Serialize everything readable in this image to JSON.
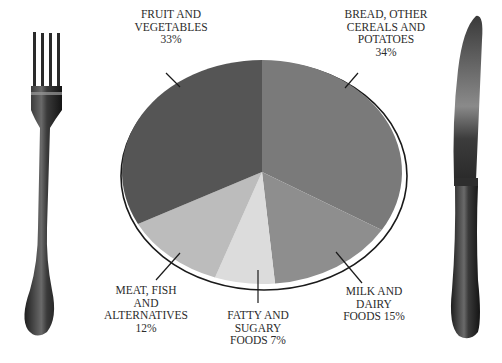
{
  "chart_data": {
    "type": "pie",
    "title": "",
    "categories": [
      "Bread, other cereals and potatoes",
      "Milk and dairy foods",
      "Fatty and sugary foods",
      "Meat, fish and alternatives",
      "Fruit and vegetables"
    ],
    "values": [
      34,
      15,
      7,
      12,
      33
    ],
    "unit": "%",
    "colors": [
      "#7a7a7a",
      "#8e8e8e",
      "#dcdcdc",
      "#bcbcbc",
      "#555555"
    ],
    "start_angle_deg": 0,
    "direction": "clockwise",
    "legend": "none (labels with leader lines)",
    "decoration": "pie drawn as a plate between a fork (left) and knife (right)"
  },
  "labels": {
    "bread": {
      "lines": [
        "BREAD, OTHER",
        "CEREALS AND",
        "POTATOES",
        "34%"
      ]
    },
    "milk": {
      "lines": [
        "MILK AND",
        "DAIRY",
        "FOODS 15%"
      ]
    },
    "fatty": {
      "lines": [
        "FATTY AND",
        "SUGARY",
        "FOODS 7%"
      ]
    },
    "meat": {
      "lines": [
        "MEAT, FISH",
        "AND",
        "ALTERNATIVES",
        "12%"
      ]
    },
    "fruit": {
      "lines": [
        "FRUIT AND",
        "VEGETABLES",
        "33%"
      ]
    }
  },
  "icons": {
    "left": "fork-icon",
    "right": "knife-icon"
  }
}
